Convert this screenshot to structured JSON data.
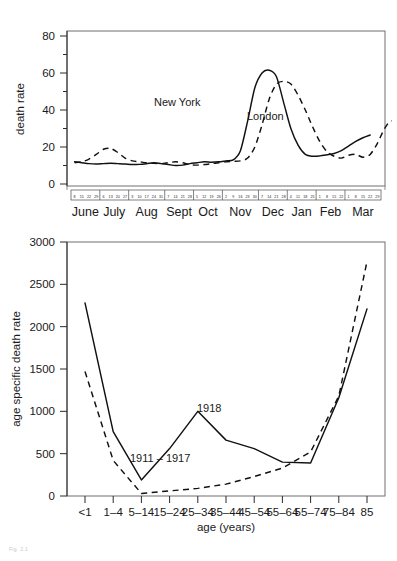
{
  "figure": {
    "caption_artifact": "Fig. 2.1"
  },
  "chart_data": [
    {
      "id": "weekly_death_rate",
      "type": "line",
      "title": "",
      "xlabel": "",
      "ylabel": "death rate",
      "ylim": [
        0,
        80
      ],
      "yticks": [
        0,
        20,
        40,
        60,
        80
      ],
      "yticks_minor": [
        10,
        30,
        50,
        70
      ],
      "grid": false,
      "legend_position": "inline-annotation",
      "months": [
        "June",
        "July",
        "Aug",
        "Sept",
        "Oct",
        "Nov",
        "Dec",
        "Jan",
        "Feb",
        "Mar"
      ],
      "week_tick_labels": [
        [
          "8",
          "15",
          "22",
          "29"
        ],
        [
          "6",
          "13",
          "20",
          "27"
        ],
        [
          "3",
          "10",
          "17",
          "24",
          "31"
        ],
        [
          "7",
          "14",
          "21",
          "28"
        ],
        [
          "5",
          "12",
          "19",
          "26"
        ],
        [
          "2",
          "9",
          "16",
          "23",
          "30"
        ],
        [
          "7",
          "14",
          "21",
          "28"
        ],
        [
          "4",
          "11",
          "18",
          "25"
        ],
        [
          "1",
          "8",
          "15",
          "22"
        ],
        [
          "1",
          "8",
          "15",
          "22",
          "29"
        ]
      ],
      "annotations": [
        {
          "text": "New York",
          "series": "New York"
        },
        {
          "text": "London",
          "series": "London"
        }
      ],
      "series": [
        {
          "name": "New York",
          "style": "solid",
          "x": [
            0,
            1,
            2,
            3,
            4,
            5,
            6,
            7,
            8,
            9,
            10,
            11,
            12,
            13,
            14,
            15,
            16,
            17,
            18,
            19,
            20,
            21,
            22,
            23,
            24,
            25,
            26,
            27,
            28,
            29,
            30,
            31,
            32,
            33,
            34,
            35,
            36,
            37,
            38,
            39,
            40,
            41
          ],
          "values": [
            12,
            11.5,
            11,
            10.8,
            11,
            11.2,
            11,
            10.8,
            10.5,
            10.6,
            11,
            11.5,
            11,
            10.5,
            10,
            10.2,
            11,
            11.5,
            12,
            11.8,
            12,
            12.5,
            13,
            18,
            34,
            52,
            60,
            61.5,
            58,
            44,
            30,
            21,
            16,
            15,
            15.2,
            15.8,
            16.5,
            18,
            20.5,
            23,
            25,
            26.5
          ]
        },
        {
          "name": "London",
          "style": "dashed",
          "x": [
            0,
            1,
            2,
            3,
            4,
            5,
            6,
            7,
            8,
            9,
            10,
            11,
            12,
            13,
            14,
            15,
            16,
            17,
            18,
            19,
            20,
            21,
            22,
            23,
            24,
            25,
            26,
            27,
            28,
            29,
            30,
            31,
            32,
            33,
            34,
            35,
            36,
            37,
            38,
            39,
            40,
            41,
            42,
            43,
            44,
            45
          ],
          "values": [
            11.5,
            12,
            13.5,
            16,
            18.8,
            19.2,
            17,
            14,
            12.5,
            12,
            11.5,
            11.2,
            11,
            11.5,
            12,
            11.5,
            10.5,
            10.2,
            10.5,
            11,
            11.5,
            12,
            12.2,
            12.5,
            14,
            20,
            32,
            46,
            54,
            55.5,
            54,
            48,
            40,
            31,
            23,
            17.5,
            15,
            14,
            15.5,
            16,
            14.5,
            16,
            22,
            30,
            34,
            25.5,
            17.5
          ]
        }
      ]
    },
    {
      "id": "age_specific_death_rate",
      "type": "line",
      "title": "",
      "xlabel": "age (years)",
      "ylabel": "age specific death rate",
      "ylim": [
        0,
        3000
      ],
      "yticks": [
        0,
        500,
        1000,
        1500,
        2000,
        2500,
        3000
      ],
      "grid": false,
      "legend_position": "inline-annotation",
      "categories": [
        "<1",
        "1–4",
        "5–14",
        "15–24",
        "25–34",
        "35–44",
        "45–54",
        "55–64",
        "55–74",
        "75–84",
        "85"
      ],
      "annotations": [
        {
          "text": "1918",
          "series": "1918"
        },
        {
          "text": "1911 – 1917",
          "series": "1911 – 1917"
        }
      ],
      "series": [
        {
          "name": "1918",
          "style": "solid",
          "values": [
            2280,
            760,
            190,
            560,
            1000,
            660,
            560,
            400,
            390,
            1160,
            2210
          ]
        },
        {
          "name": "1911 – 1917",
          "style": "dashed",
          "values": [
            1470,
            420,
            30,
            60,
            90,
            140,
            230,
            330,
            520,
            1180,
            2770
          ]
        }
      ]
    }
  ]
}
